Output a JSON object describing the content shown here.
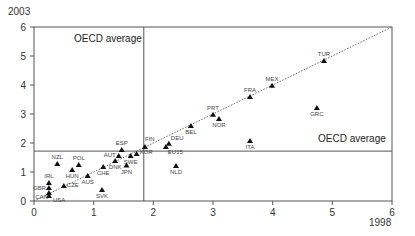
{
  "chart_data": {
    "type": "scatter",
    "title": "",
    "xlabel": "1998",
    "ylabel": "2003",
    "xlim": [
      0,
      6
    ],
    "ylim": [
      0,
      6
    ],
    "xticks": [
      0,
      1,
      2,
      3,
      4,
      5,
      6
    ],
    "yticks": [
      0,
      1,
      2,
      3,
      4,
      5,
      6
    ],
    "grid": false,
    "legend": null,
    "marker": "triangle",
    "reference_lines": {
      "diagonal": {
        "style": "dotted",
        "from": [
          0,
          0
        ],
        "to": [
          6,
          6
        ]
      },
      "oecd_average_x": 1.84,
      "oecd_average_y": 1.72
    },
    "annotations": [
      {
        "text": "OECD average",
        "position": "top-left quadrant, near vertical line"
      },
      {
        "text": "OECD average",
        "position": "right side, above horizontal line"
      }
    ],
    "points": [
      {
        "label": "USA",
        "x": 0.25,
        "y": 0.17
      },
      {
        "label": "CAN",
        "x": 0.25,
        "y": 0.28
      },
      {
        "label": "GBR",
        "x": 0.25,
        "y": 0.45
      },
      {
        "label": "IRL",
        "x": 0.25,
        "y": 0.62
      },
      {
        "label": "CZE",
        "x": 0.5,
        "y": 0.52
      },
      {
        "label": "NZL",
        "x": 0.39,
        "y": 1.28
      },
      {
        "label": "HUN",
        "x": 0.64,
        "y": 1.07
      },
      {
        "label": "POL",
        "x": 0.75,
        "y": 1.24
      },
      {
        "label": "AUS",
        "x": 0.9,
        "y": 0.86
      },
      {
        "label": "SVK",
        "x": 1.14,
        "y": 0.38
      },
      {
        "label": "CHE",
        "x": 1.16,
        "y": 1.17
      },
      {
        "label": "DNK",
        "x": 1.36,
        "y": 1.38
      },
      {
        "label": "AUT",
        "x": 1.42,
        "y": 1.55
      },
      {
        "label": "ESP",
        "x": 1.47,
        "y": 1.76
      },
      {
        "label": "JPN",
        "x": 1.55,
        "y": 1.22
      },
      {
        "label": "SWE",
        "x": 1.62,
        "y": 1.55
      },
      {
        "label": "KOR",
        "x": 1.72,
        "y": 1.62
      },
      {
        "label": "FIN",
        "x": 1.86,
        "y": 1.86
      },
      {
        "label": "EU15",
        "x": 2.21,
        "y": 1.86
      },
      {
        "label": "DEU",
        "x": 2.26,
        "y": 1.97
      },
      {
        "label": "NLD",
        "x": 2.38,
        "y": 1.21
      },
      {
        "label": "BEL",
        "x": 2.63,
        "y": 2.59
      },
      {
        "label": "PRT",
        "x": 3.0,
        "y": 2.97
      },
      {
        "label": "NOR",
        "x": 3.1,
        "y": 2.83
      },
      {
        "label": "ITA",
        "x": 3.62,
        "y": 2.07
      },
      {
        "label": "FRA",
        "x": 3.62,
        "y": 3.59
      },
      {
        "label": "MEX",
        "x": 3.99,
        "y": 3.97
      },
      {
        "label": "GRC",
        "x": 4.74,
        "y": 3.21
      },
      {
        "label": "TUR",
        "x": 4.86,
        "y": 4.83
      }
    ]
  },
  "layout": {
    "plot_left": 34,
    "plot_right": 392,
    "plot_top": 27,
    "plot_bottom": 201,
    "colors": {
      "axis": "#555555",
      "marker": "#111111",
      "ref_line": "#555555",
      "diag": "#666666"
    }
  }
}
